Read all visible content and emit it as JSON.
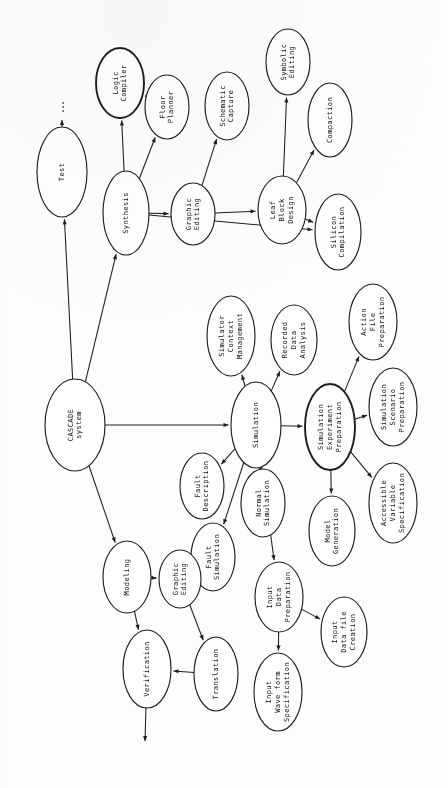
{
  "diagram": {
    "orientation": "rotated-90-ccw",
    "type": "directed-graph",
    "background_color": "#fdfdfc",
    "stroke_color": "#1d1d1d",
    "text_color": "#111111",
    "nodes": [
      {
        "id": "cascade",
        "label": "CASCADE\nsystem",
        "cx": 75,
        "cy": 425,
        "rx": 30,
        "ry": 46,
        "bold": false
      },
      {
        "id": "test",
        "label": "Test",
        "cx": 62,
        "cy": 172,
        "rx": 25,
        "ry": 45,
        "bold": false
      },
      {
        "id": "synthesis",
        "label": "Synthesis",
        "cx": 126,
        "cy": 213,
        "rx": 23,
        "ry": 42,
        "bold": false
      },
      {
        "id": "logic_compiler",
        "label": "Logic\nCompiler",
        "cx": 120,
        "cy": 83,
        "rx": 24,
        "ry": 35,
        "bold": true
      },
      {
        "id": "floor_planner",
        "label": "Floor\nPlanner",
        "cx": 167,
        "cy": 107,
        "rx": 22,
        "ry": 32,
        "bold": false
      },
      {
        "id": "graphic_editing_top",
        "label": "Graphic\nEditing",
        "cx": 193,
        "cy": 214,
        "rx": 22,
        "ry": 31,
        "bold": false
      },
      {
        "id": "schematic_capture",
        "label": "Schematic\nCapture",
        "cx": 227,
        "cy": 106,
        "rx": 22,
        "ry": 34,
        "bold": false
      },
      {
        "id": "leaf_block",
        "label": "Leaf\nBlock\nDesign",
        "cx": 282,
        "cy": 210,
        "rx": 24,
        "ry": 34,
        "bold": false
      },
      {
        "id": "symbolic_editing",
        "label": "Symbolic\nEditing",
        "cx": 288,
        "cy": 62,
        "rx": 22,
        "ry": 33,
        "bold": false
      },
      {
        "id": "compaction",
        "label": "Compaction",
        "cx": 330,
        "cy": 120,
        "rx": 22,
        "ry": 37,
        "bold": false
      },
      {
        "id": "silicon_comp",
        "label": "Silicon\nCompilation",
        "cx": 338,
        "cy": 232,
        "rx": 23,
        "ry": 38,
        "bold": false
      },
      {
        "id": "sim_ctx",
        "label": "Simulator\nContext\nManagement",
        "cx": 231,
        "cy": 336,
        "rx": 24,
        "ry": 40,
        "bold": false
      },
      {
        "id": "recorded_data",
        "label": "Recorded\nData\nAnalysis",
        "cx": 294,
        "cy": 340,
        "rx": 23,
        "ry": 35,
        "bold": false
      },
      {
        "id": "action_file",
        "label": "Action\nFile\nPreparation",
        "cx": 373,
        "cy": 322,
        "rx": 24,
        "ry": 38,
        "bold": false
      },
      {
        "id": "simulation",
        "label": "Simulation",
        "cx": 256,
        "cy": 425,
        "rx": 25,
        "ry": 43,
        "bold": false
      },
      {
        "id": "sim_exp_prep",
        "label": "Simulation\nExperiment\nPreparation",
        "cx": 330,
        "cy": 427,
        "rx": 25,
        "ry": 43,
        "bold": true
      },
      {
        "id": "sim_scenario",
        "label": "Simulation\nScenario\nPreparation",
        "cx": 393,
        "cy": 407,
        "rx": 24,
        "ry": 39,
        "bold": false
      },
      {
        "id": "accessible_var",
        "label": "Accessible\nVariable\nSpecification",
        "cx": 393,
        "cy": 503,
        "rx": 24,
        "ry": 40,
        "bold": false
      },
      {
        "id": "model_gen",
        "label": "Model\nGeneration",
        "cx": 332,
        "cy": 531,
        "rx": 23,
        "ry": 35,
        "bold": false
      },
      {
        "id": "fault_desc",
        "label": "Fault\nDescription",
        "cx": 202,
        "cy": 486,
        "rx": 22,
        "ry": 33,
        "bold": false
      },
      {
        "id": "normal_sim",
        "label": "Normal\nSimulation",
        "cx": 263,
        "cy": 503,
        "rx": 22,
        "ry": 34,
        "bold": false
      },
      {
        "id": "fault_sim",
        "label": "Fault\nSimulation",
        "cx": 213,
        "cy": 557,
        "rx": 22,
        "ry": 34,
        "bold": false
      },
      {
        "id": "input_data_prep",
        "label": "Input\nData\nPreparation",
        "cx": 279,
        "cy": 597,
        "rx": 24,
        "ry": 35,
        "bold": false
      },
      {
        "id": "input_data_file",
        "label": "Input\nData file\nCreation",
        "cx": 344,
        "cy": 632,
        "rx": 23,
        "ry": 35,
        "bold": false
      },
      {
        "id": "input_wave",
        "label": "Input\nWave form\nSpecification",
        "cx": 278,
        "cy": 692,
        "rx": 24,
        "ry": 39,
        "bold": false
      },
      {
        "id": "modeling",
        "label": "Modeling",
        "cx": 127,
        "cy": 577,
        "rx": 24,
        "ry": 36,
        "bold": false
      },
      {
        "id": "graphic_editing_low",
        "label": "Graphic\nEditing",
        "cx": 180,
        "cy": 579,
        "rx": 21,
        "ry": 29,
        "bold": false
      },
      {
        "id": "verification",
        "label": "Verification",
        "cx": 147,
        "cy": 669,
        "rx": 24,
        "ry": 39,
        "bold": false
      },
      {
        "id": "translation",
        "label": "Translation",
        "cx": 216,
        "cy": 674,
        "rx": 22,
        "ry": 37,
        "bold": false
      }
    ],
    "edges": [
      {
        "from": "cascade",
        "to": "test",
        "label": ""
      },
      {
        "from": "cascade",
        "to": "synthesis",
        "label": ""
      },
      {
        "from": "cascade",
        "to": "simulation",
        "label": ""
      },
      {
        "from": "cascade",
        "to": "modeling",
        "label": ""
      },
      {
        "from": "synthesis",
        "to": "logic_compiler",
        "label": ""
      },
      {
        "from": "synthesis",
        "to": "floor_planner",
        "label": ""
      },
      {
        "from": "synthesis",
        "to": "graphic_editing_top",
        "label": ""
      },
      {
        "from": "synthesis",
        "to": "silicon_comp",
        "label": ""
      },
      {
        "from": "floor_planner",
        "to": "logic_compiler",
        "label": ""
      },
      {
        "from": "graphic_editing_top",
        "to": "schematic_capture",
        "label": ""
      },
      {
        "from": "graphic_editing_top",
        "to": "leaf_block",
        "label": ""
      },
      {
        "from": "leaf_block",
        "to": "symbolic_editing",
        "label": ""
      },
      {
        "from": "leaf_block",
        "to": "compaction",
        "label": ""
      },
      {
        "from": "leaf_block",
        "to": "silicon_comp",
        "label": ""
      },
      {
        "from": "simulation",
        "to": "sim_ctx",
        "label": ""
      },
      {
        "from": "simulation",
        "to": "recorded_data",
        "label": ""
      },
      {
        "from": "simulation",
        "to": "sim_exp_prep",
        "label": ""
      },
      {
        "from": "simulation",
        "to": "fault_desc",
        "label": ""
      },
      {
        "from": "simulation",
        "to": "normal_sim",
        "label": ""
      },
      {
        "from": "simulation",
        "to": "fault_sim",
        "label": ""
      },
      {
        "from": "simulation",
        "to": "input_data_prep",
        "label": ""
      },
      {
        "from": "sim_exp_prep",
        "to": "action_file",
        "label": ""
      },
      {
        "from": "sim_exp_prep",
        "to": "sim_scenario",
        "label": ""
      },
      {
        "from": "sim_exp_prep",
        "to": "accessible_var",
        "label": ""
      },
      {
        "from": "sim_exp_prep",
        "to": "model_gen",
        "label": ""
      },
      {
        "from": "input_data_prep",
        "to": "input_data_file",
        "label": ""
      },
      {
        "from": "input_data_prep",
        "to": "input_wave",
        "label": ""
      },
      {
        "from": "modeling",
        "to": "graphic_editing_low",
        "label": ""
      },
      {
        "from": "modeling",
        "to": "verification",
        "label": ""
      },
      {
        "from": "graphic_editing_low",
        "to": "translation",
        "label": ""
      },
      {
        "from": "translation",
        "to": "verification",
        "label": ""
      }
    ],
    "open_edges": [
      {
        "id": "test-continues",
        "from": "test",
        "note": "arrow to ellipsis"
      },
      {
        "id": "verification-continues",
        "from": "verification",
        "note": "arrow off page"
      }
    ],
    "ellipsis_marker": "..."
  }
}
